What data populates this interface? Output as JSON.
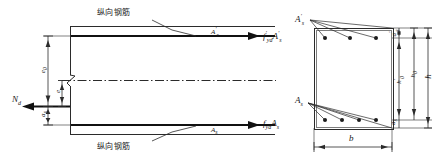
{
  "figure": {
    "type": "engineering-diagram",
    "line_color": "#2b2b2b",
    "bar_color": "#1a1a1a",
    "background": "#ffffff"
  },
  "elevation": {
    "name": "elevation-view",
    "top_callout": "纵向钢筋",
    "bottom_callout": "纵向钢筋",
    "top_bar_label": "A's",
    "bottom_bar_label": "As",
    "axial_force": "Nd",
    "top_force": "f'ydA's",
    "bottom_force": "fydAs",
    "dim_e0": "e0",
    "dim_e": "e",
    "dim_as": "as",
    "break_symbol": "Z"
  },
  "section": {
    "name": "cross-section-view",
    "top_steel_label": "A's",
    "bottom_steel_label": "As",
    "dim_width": "b",
    "dim_h": "h",
    "dim_h0": "h0",
    "dim_h0_prime": "h'0",
    "dim_as_prime_top": "a's",
    "dim_as_bottom": "as",
    "top_bar_count": 3,
    "bottom_bar_count": 4
  }
}
